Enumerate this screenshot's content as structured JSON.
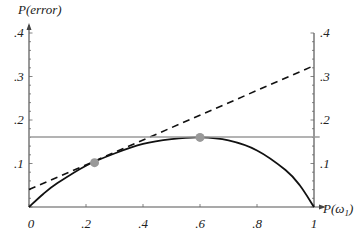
{
  "chart_data": {
    "type": "line",
    "title": "",
    "xlabel": "P(ω1)",
    "ylabel": "P(error)",
    "xlim": [
      0,
      1
    ],
    "ylim": [
      0,
      0.4
    ],
    "x_ticks": [
      "0",
      ".2",
      ".4",
      ".6",
      ".8",
      "1"
    ],
    "y_ticks_left": [
      ".1",
      ".2",
      ".3",
      ".4"
    ],
    "y_ticks_right": [
      ".1",
      ".2",
      ".3",
      ".4"
    ],
    "grid": false,
    "series": [
      {
        "name": "Bayes error curve",
        "style": "solid-black",
        "x": [
          0,
          0.05,
          0.1,
          0.2,
          0.3,
          0.4,
          0.5,
          0.6,
          0.7,
          0.8,
          0.9,
          0.95,
          1.0
        ],
        "y": [
          0,
          0.03,
          0.055,
          0.095,
          0.123,
          0.145,
          0.156,
          0.16,
          0.153,
          0.13,
          0.085,
          0.05,
          0
        ]
      },
      {
        "name": "Tangent line at P(ω1)≈0.23",
        "style": "dashed-black",
        "x": [
          0,
          1
        ],
        "y": [
          0.04,
          0.325
        ]
      },
      {
        "name": "Horizontal max-error line",
        "style": "solid-gray",
        "x": [
          0,
          1.02
        ],
        "y": [
          0.161,
          0.161
        ]
      }
    ],
    "points": [
      {
        "name": "tangent point",
        "x": 0.23,
        "y": 0.102,
        "color": "#999999"
      },
      {
        "name": "maximum point",
        "x": 0.6,
        "y": 0.16,
        "color": "#999999"
      }
    ]
  },
  "labels": {
    "ylabel": "P(error)",
    "xlabel_main": "P(ω",
    "xlabel_sub": "1",
    "xlabel_close": ")"
  }
}
